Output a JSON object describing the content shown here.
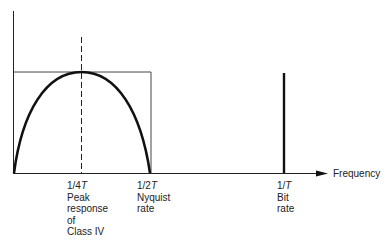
{
  "diagram": {
    "axis": {
      "x_label": "Frequency"
    },
    "markers": [
      {
        "id": "quarter",
        "value": "1/4T",
        "value_num": "1/4",
        "value_var": "T",
        "desc": [
          "Peak",
          "response",
          "of",
          "Class IV"
        ]
      },
      {
        "id": "half",
        "value": "1/2T",
        "value_num": "1/2",
        "value_var": "T",
        "desc": [
          "Nyquist",
          "rate"
        ]
      },
      {
        "id": "full",
        "value": "1/T",
        "value_num": "1/",
        "value_var": "T",
        "desc": [
          "Bit",
          "rate"
        ]
      }
    ],
    "elements": [
      "rectangular ideal Nyquist spectrum (0 to 1/2T)",
      "Class IV half-sine response peaking at 1/4T",
      "dashed vertical line at 1/4T",
      "spectral line at bit rate 1/T"
    ],
    "colors": {
      "line": "#111111",
      "thin": "#333333"
    }
  }
}
